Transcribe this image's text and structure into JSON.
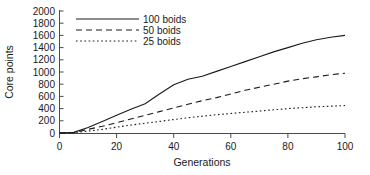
{
  "chart_data": {
    "type": "line",
    "title": "",
    "xlabel": "Generations",
    "ylabel": "Core points",
    "xlim": [
      0,
      100
    ],
    "ylim": [
      0,
      2000
    ],
    "xticks": [
      0,
      20,
      40,
      60,
      80,
      100
    ],
    "yticks": [
      0,
      200,
      400,
      600,
      800,
      1000,
      1200,
      1400,
      1600,
      1800,
      2000
    ],
    "grid": false,
    "legend_position": "top-left",
    "x": [
      0,
      5,
      10,
      15,
      20,
      25,
      30,
      35,
      40,
      45,
      50,
      55,
      60,
      65,
      70,
      75,
      80,
      85,
      90,
      95,
      100
    ],
    "series": [
      {
        "name": "100 boids",
        "style": "solid",
        "values": [
          0,
          10,
          90,
          190,
          290,
          390,
          480,
          640,
          790,
          880,
          930,
          1010,
          1090,
          1170,
          1250,
          1330,
          1400,
          1470,
          1530,
          1570,
          1600
        ]
      },
      {
        "name": "50 boids",
        "style": "dashed",
        "values": [
          0,
          5,
          60,
          110,
          170,
          230,
          290,
          350,
          410,
          470,
          530,
          580,
          640,
          700,
          750,
          800,
          850,
          890,
          920,
          955,
          980
        ]
      },
      {
        "name": "25 boids",
        "style": "dotted",
        "values": [
          0,
          5,
          30,
          60,
          95,
          130,
          160,
          190,
          220,
          250,
          275,
          300,
          320,
          340,
          360,
          380,
          400,
          415,
          430,
          440,
          450
        ]
      }
    ]
  },
  "axes": {
    "y_tick_labels": [
      "2000",
      "1800",
      "1600",
      "1400",
      "1200",
      "1000",
      "800",
      "600",
      "400",
      "200",
      "0"
    ],
    "x_tick_labels": [
      "0",
      "20",
      "40",
      "60",
      "80",
      "100"
    ],
    "y_axis_title": "Core points",
    "x_axis_title": "Generations"
  },
  "legend": {
    "entries": [
      {
        "label": "100 boids",
        "style": "solid"
      },
      {
        "label": "50 boids",
        "style": "dashed"
      },
      {
        "label": "25 boids",
        "style": "dotted"
      }
    ]
  },
  "colors": {
    "line": "#1a1a1a",
    "axis": "#4a4a4a",
    "background": "#ffffff"
  }
}
